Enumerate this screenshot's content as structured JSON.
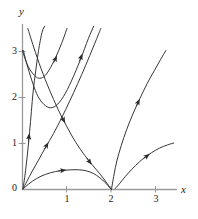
{
  "figure": {
    "title": "",
    "type": "phase-portrait"
  },
  "axes": {
    "x_label": "x",
    "y_label": "y",
    "x_ticks": [
      "1",
      "2",
      "3"
    ],
    "y_ticks": [
      "0",
      "1",
      "2",
      "3"
    ],
    "origin_label": "0"
  },
  "colors": {
    "axis": "#8c8c8c",
    "curve": "#2b2b2b",
    "background": "#ffffff",
    "text": "#1a1a1a"
  },
  "chart_data": {
    "type": "line",
    "title": "",
    "xlabel": "x",
    "ylabel": "y",
    "xlim": [
      0,
      3.55
    ],
    "ylim": [
      0,
      3.55
    ],
    "grid": false,
    "legend": "none",
    "x_tick_values": [
      1,
      2,
      3
    ],
    "y_tick_values": [
      0,
      1,
      2,
      3
    ],
    "equilibria": [
      {
        "point": [
          0,
          0
        ],
        "kind": "unstable-node"
      },
      {
        "point": [
          2,
          0
        ],
        "kind": "saddle"
      }
    ],
    "series": [
      {
        "name": "trajectory-1",
        "note": "from (0,3) descending to minimum near (0.35,2.4) then rising steeply up-right",
        "points": [
          [
            0.0,
            3.02
          ],
          [
            0.08,
            2.78
          ],
          [
            0.17,
            2.6
          ],
          [
            0.27,
            2.48
          ],
          [
            0.36,
            2.42
          ],
          [
            0.48,
            2.45
          ],
          [
            0.6,
            2.6
          ],
          [
            0.74,
            2.86
          ],
          [
            0.88,
            3.18
          ],
          [
            1.0,
            3.5
          ]
        ],
        "arrows": [
          {
            "at": [
              0.72,
              2.8
            ],
            "dir": "up-right"
          }
        ]
      },
      {
        "name": "trajectory-2",
        "note": "from (0,3) steeply down to minimum near (0.6,1.75) then rising up-right",
        "points": [
          [
            0.02,
            3.02
          ],
          [
            0.1,
            2.72
          ],
          [
            0.2,
            2.4
          ],
          [
            0.32,
            2.08
          ],
          [
            0.45,
            1.88
          ],
          [
            0.6,
            1.78
          ],
          [
            0.75,
            1.82
          ],
          [
            0.92,
            2.02
          ],
          [
            1.1,
            2.36
          ],
          [
            1.3,
            2.82
          ],
          [
            1.48,
            3.28
          ],
          [
            1.6,
            3.55
          ]
        ],
        "arrows": [
          {
            "at": [
              1.3,
              2.84
            ],
            "dir": "up-right"
          }
        ]
      },
      {
        "name": "trajectory-3",
        "note": "separatrix entering saddle region: from upper-left down through (1.55,0.52) toward (2,0)",
        "points": [
          [
            0.12,
            3.5
          ],
          [
            0.25,
            3.1
          ],
          [
            0.42,
            2.62
          ],
          [
            0.6,
            2.18
          ],
          [
            0.8,
            1.74
          ],
          [
            1.0,
            1.36
          ],
          [
            1.2,
            1.02
          ],
          [
            1.4,
            0.74
          ],
          [
            1.58,
            0.52
          ],
          [
            1.74,
            0.34
          ],
          [
            1.88,
            0.16
          ],
          [
            1.98,
            0.02
          ]
        ],
        "arrows": [
          {
            "at": [
              0.9,
              1.55
            ],
            "dir": "down-right"
          },
          {
            "at": [
              1.48,
              0.64
            ],
            "dir": "down-right"
          }
        ]
      },
      {
        "name": "trajectory-4",
        "note": "leaves origin along steep direction, rises nearly vertically to upper boundary",
        "points": [
          [
            0.01,
            0.02
          ],
          [
            0.04,
            0.2
          ],
          [
            0.08,
            0.5
          ],
          [
            0.12,
            0.86
          ],
          [
            0.16,
            1.26
          ],
          [
            0.2,
            1.7
          ],
          [
            0.24,
            2.14
          ],
          [
            0.3,
            2.6
          ],
          [
            0.36,
            3.02
          ],
          [
            0.44,
            3.42
          ],
          [
            0.5,
            3.55
          ]
        ],
        "arrows": [
          {
            "at": [
              0.14,
              1.1
            ],
            "dir": "up"
          }
        ]
      },
      {
        "name": "trajectory-5",
        "note": "leaves origin at moderate slope, curving up toward the upper-right",
        "points": [
          [
            0.01,
            0.01
          ],
          [
            0.1,
            0.18
          ],
          [
            0.22,
            0.4
          ],
          [
            0.36,
            0.64
          ],
          [
            0.52,
            0.92
          ],
          [
            0.7,
            1.22
          ],
          [
            0.88,
            1.56
          ],
          [
            1.06,
            1.92
          ],
          [
            1.24,
            2.3
          ],
          [
            1.42,
            2.7
          ],
          [
            1.6,
            3.12
          ],
          [
            1.76,
            3.5
          ]
        ],
        "arrows": [
          {
            "at": [
              0.52,
              0.92
            ],
            "dir": "up-right"
          }
        ]
      },
      {
        "name": "trajectory-6",
        "note": "leaves origin at shallow slope, peaks near (1.35,0.42) then drops into saddle at (2,0)",
        "points": [
          [
            0.01,
            0.01
          ],
          [
            0.14,
            0.12
          ],
          [
            0.32,
            0.24
          ],
          [
            0.52,
            0.33
          ],
          [
            0.74,
            0.39
          ],
          [
            0.96,
            0.42
          ],
          [
            1.18,
            0.43
          ],
          [
            1.36,
            0.42
          ],
          [
            1.52,
            0.38
          ],
          [
            1.66,
            0.31
          ],
          [
            1.78,
            0.22
          ],
          [
            1.88,
            0.13
          ],
          [
            1.96,
            0.04
          ],
          [
            2.0,
            0.0
          ]
        ],
        "arrows": [
          {
            "at": [
              0.86,
              0.41
            ],
            "dir": "right"
          }
        ]
      },
      {
        "name": "trajectory-7",
        "note": "emerges from saddle at (2,0) and rises up-right steeply",
        "points": [
          [
            2.0,
            0.0
          ],
          [
            2.02,
            0.12
          ],
          [
            2.06,
            0.34
          ],
          [
            2.12,
            0.62
          ],
          [
            2.22,
            0.96
          ],
          [
            2.34,
            1.3
          ],
          [
            2.48,
            1.64
          ],
          [
            2.64,
            1.98
          ],
          [
            2.8,
            2.3
          ],
          [
            2.96,
            2.58
          ],
          [
            3.1,
            2.82
          ],
          [
            3.22,
            3.02
          ]
        ],
        "arrows": [
          {
            "at": [
              2.58,
              1.86
            ],
            "dir": "up-right"
          }
        ]
      },
      {
        "name": "trajectory-8",
        "note": "lower right trajectory, flat near axis then rising to the right",
        "points": [
          [
            2.08,
            0.02
          ],
          [
            2.14,
            0.08
          ],
          [
            2.24,
            0.2
          ],
          [
            2.38,
            0.36
          ],
          [
            2.54,
            0.52
          ],
          [
            2.72,
            0.68
          ],
          [
            2.9,
            0.8
          ],
          [
            3.08,
            0.9
          ],
          [
            3.26,
            0.97
          ],
          [
            3.4,
            1.01
          ]
        ],
        "arrows": [
          {
            "at": [
              2.76,
              0.7
            ],
            "dir": "up-right"
          }
        ]
      }
    ]
  }
}
